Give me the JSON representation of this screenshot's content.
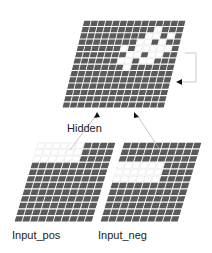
{
  "labels": {
    "hidden": "Hidden",
    "input_pos": "Input_pos",
    "input_neg": "Input_neg"
  },
  "colors": {
    "cell_dark": "#5a5a5a",
    "cell_light": "#ffffff",
    "grid_line": "#d8d8d8",
    "connector": "#bbbbbb",
    "arrow": "#111111"
  },
  "grids": {
    "hidden": {
      "rows": 14,
      "cols": 14
    },
    "input_pos": {
      "rows": 12,
      "cols": 10
    },
    "input_neg": {
      "rows": 12,
      "cols": 10
    }
  }
}
